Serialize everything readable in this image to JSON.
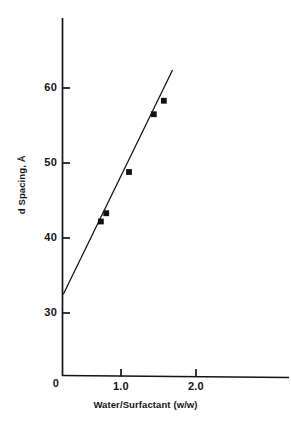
{
  "chart_data": {
    "type": "scatter",
    "title": "",
    "subtitle": "",
    "xlabel": "Water/Surfactant (w/w)",
    "ylabel": "d Spacing, Å",
    "xlim": [
      0,
      2.9
    ],
    "ylim": [
      0,
      67
    ],
    "grid": false,
    "legend": null,
    "x_ticks": [
      {
        "value": 0,
        "label": "0",
        "px": 62
      },
      {
        "value": 1.0,
        "label": "1.0",
        "px": 121
      },
      {
        "value": 2.0,
        "label": "2.0",
        "px": 196
      }
    ],
    "y_ticks": [
      {
        "value": 30,
        "label": "30",
        "px": 313
      },
      {
        "value": 40,
        "label": "40",
        "px": 238
      },
      {
        "value": 50,
        "label": "50",
        "px": 163
      },
      {
        "value": 60,
        "label": "60",
        "px": 88
      }
    ],
    "series": [
      {
        "name": "d Spacing",
        "marker": "filled-square",
        "color": "#111111",
        "points": [
          {
            "x": 0.58,
            "y": 42.2
          },
          {
            "x": 0.66,
            "y": 43.3
          },
          {
            "x": 1.0,
            "y": 48.8
          },
          {
            "x": 1.37,
            "y": 56.5
          },
          {
            "x": 1.52,
            "y": 58.3
          }
        ]
      }
    ],
    "fit_line": {
      "name": "linear fit",
      "color": "#111111",
      "intercept": 32.5,
      "slope": 18.3,
      "x_start": 0.02,
      "x_end": 1.65,
      "y_start": 32.5,
      "y_end": 62.4
    },
    "axis_color": "#141414",
    "background_color": "#ffffff"
  },
  "axes": {
    "x_title": "Water/Surfactant (w/w)",
    "y_title": "d Spacing, Å"
  },
  "ticks": {
    "x": [
      "0",
      "1.0",
      "2.0"
    ],
    "y": [
      "30",
      "40",
      "50",
      "60"
    ]
  }
}
